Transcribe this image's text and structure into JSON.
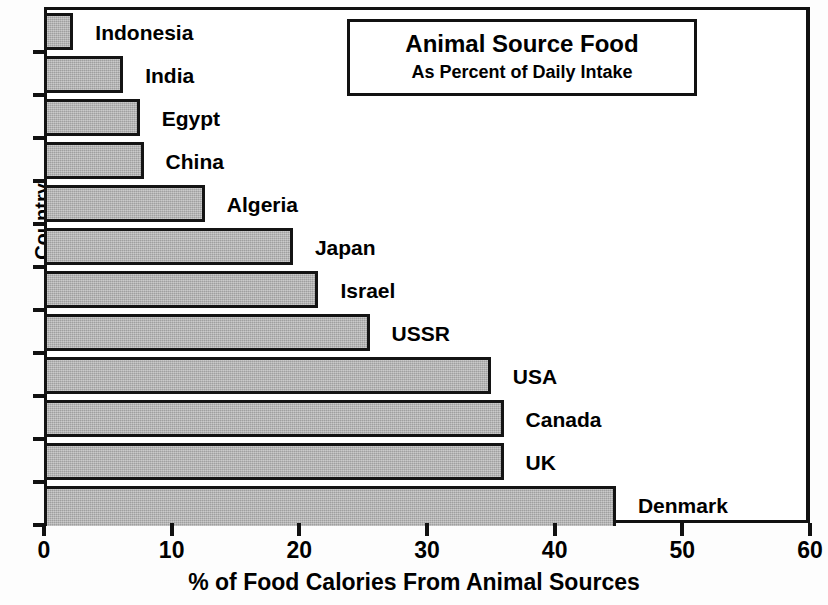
{
  "chart_data": {
    "type": "bar",
    "orientation": "horizontal",
    "title": "Animal Source Food",
    "subtitle": "As Percent of Daily Intake",
    "xlabel": "% of Food Calories From Animal Sources",
    "ylabel": "Country",
    "xlim": [
      0,
      60
    ],
    "xticks": [
      0,
      10,
      20,
      30,
      40,
      50,
      60
    ],
    "xtick_labels": [
      "0",
      "10",
      "20",
      "30",
      "40",
      "50",
      "60"
    ],
    "grid": false,
    "legend": false,
    "bar_fill_color": "#b2b2b2",
    "bar_edge_color": "#141414",
    "categories": [
      "Indonesia",
      "India",
      "Egypt",
      "China",
      "Algeria",
      "Japan",
      "Israel",
      "USSR",
      "USA",
      "Canada",
      "UK",
      "Denmark"
    ],
    "values": [
      2.3,
      6.2,
      7.5,
      7.8,
      12.6,
      19.5,
      21.5,
      25.5,
      35.0,
      36.0,
      36.0,
      44.8
    ]
  }
}
